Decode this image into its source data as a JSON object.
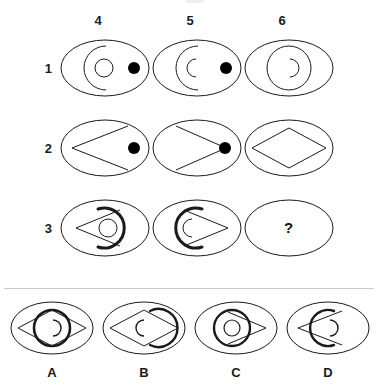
{
  "figure": {
    "canvas": {
      "width": 378,
      "height": 390,
      "background": "#ffffff"
    },
    "stroke_color": "#1a1a1a",
    "dot_color": "#000000"
  },
  "matrix": {
    "column_labels": [
      "4",
      "5",
      "6"
    ],
    "row_labels": [
      "1",
      "2",
      "3"
    ],
    "missing_cell_symbol": "?",
    "cells": [
      {
        "row": "1",
        "column": "4",
        "name": "cell-r1-c4",
        "elements": [
          "outer-ellipse",
          "large-c-arc-open-right",
          "small-circle",
          "filled-dot-right"
        ]
      },
      {
        "row": "1",
        "column": "5",
        "name": "cell-r1-c5",
        "elements": [
          "outer-ellipse",
          "large-c-arc-open-right",
          "small-c-arc-open-right",
          "filled-dot-right"
        ]
      },
      {
        "row": "1",
        "column": "6",
        "name": "cell-r1-c6",
        "elements": [
          "outer-ellipse",
          "medium-circle",
          "small-c-arc-open-left"
        ]
      },
      {
        "row": "2",
        "column": "4",
        "name": "cell-r2-c4",
        "elements": [
          "outer-ellipse",
          "left-chevron",
          "filled-dot-right"
        ]
      },
      {
        "row": "2",
        "column": "5",
        "name": "cell-r2-c5",
        "elements": [
          "outer-ellipse",
          "right-chevron",
          "filled-dot-center-right"
        ]
      },
      {
        "row": "2",
        "column": "6",
        "name": "cell-r2-c6",
        "elements": [
          "outer-ellipse",
          "diamond"
        ]
      },
      {
        "row": "3",
        "column": "4",
        "name": "cell-r3-c4",
        "elements": [
          "outer-ellipse",
          "left-chevron",
          "thick-c-arc-open-left",
          "small-circle"
        ]
      },
      {
        "row": "3",
        "column": "5",
        "name": "cell-r3-c5",
        "elements": [
          "outer-ellipse",
          "right-chevron",
          "thick-c-arc-open-right",
          "small-c-arc-open-right"
        ]
      },
      {
        "row": "3",
        "column": "6",
        "name": "cell-r3-c6-question",
        "elements": [
          "outer-ellipse",
          "question-mark"
        ]
      }
    ]
  },
  "options": [
    {
      "label": "A",
      "name": "option-a",
      "elements": [
        "outer-ellipse",
        "diamond",
        "thick-circle",
        "small-c-arc-open-left"
      ]
    },
    {
      "label": "B",
      "name": "option-b",
      "elements": [
        "outer-ellipse",
        "diamond",
        "thick-arc-right",
        "small-c-arc-open-right"
      ]
    },
    {
      "label": "C",
      "name": "option-c",
      "elements": [
        "outer-ellipse",
        "right-chevron",
        "thick-circle",
        "small-circle"
      ]
    },
    {
      "label": "D",
      "name": "option-d",
      "elements": [
        "outer-ellipse",
        "left-chevron",
        "thick-c-arc-open-right",
        "small-c-arc-open-left"
      ]
    }
  ]
}
